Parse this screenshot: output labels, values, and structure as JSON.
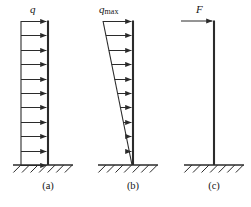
{
  "figure": {
    "type": "engineering-diagram",
    "background": "#ffffff",
    "stroke_color": "#2b2b2b",
    "width": 251,
    "height": 207
  },
  "panels": [
    {
      "id": "a",
      "caption": "(a)",
      "caption_x": 28,
      "caption_y": 180,
      "load_label": "q",
      "load_label_sub": "",
      "load_label_x": 30,
      "load_label_y": 3,
      "load_type": "uniform",
      "column_x": 48,
      "column_top": 21,
      "column_bottom": 165,
      "arrow_tail_x_top": 21,
      "arrow_tail_x_bottom": 21,
      "arrow_count": 11,
      "ground_x1": 13,
      "ground_x2": 73,
      "ground_y": 165,
      "hatch_count": 7
    },
    {
      "id": "b",
      "caption": "(b)",
      "caption_x": 113,
      "caption_y": 180,
      "load_label": "q",
      "load_label_sub": "max",
      "load_label_x": 99,
      "load_label_y": 3,
      "load_type": "triangular",
      "column_x": 133,
      "column_top": 21,
      "column_bottom": 165,
      "arrow_tail_x_top": 103,
      "arrow_tail_x_bottom": 132,
      "arrow_count": 11,
      "ground_x1": 98,
      "ground_x2": 158,
      "ground_y": 165,
      "hatch_count": 7
    },
    {
      "id": "c",
      "caption": "(c)",
      "caption_x": 194,
      "caption_y": 180,
      "load_label": "F",
      "load_label_sub": "",
      "load_label_x": 196,
      "load_label_y": 3,
      "load_type": "point",
      "column_x": 214,
      "column_top": 21,
      "column_bottom": 165,
      "arrow_tail_x_top": 181,
      "arrow_tail_x_bottom": 181,
      "arrow_count": 1,
      "ground_x1": 184,
      "ground_x2": 244,
      "ground_y": 165,
      "hatch_count": 7
    }
  ]
}
